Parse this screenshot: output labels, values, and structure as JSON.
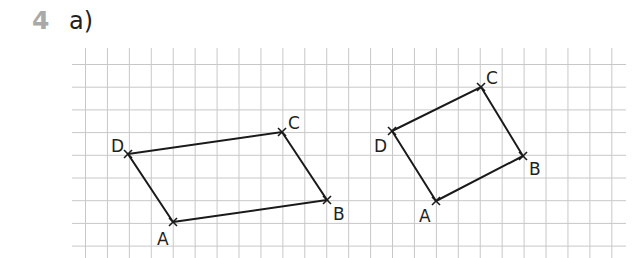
{
  "header": {
    "exercise_number": "4",
    "part_label": "a)",
    "exercise_number_color": "#a9a9a9"
  },
  "grid": {
    "x_start": 72,
    "x_end": 626,
    "y_top": 48,
    "y_bottom": 258,
    "first_vertical_x": 85.5,
    "vertical_count": 25,
    "vertical_spacing": 21.93,
    "first_horizontal_y": 64.5,
    "horizontal_count": 9,
    "horizontal_spacing": 22.7,
    "line_color": "#c8c8c8"
  },
  "shapes": [
    {
      "name": "parallelogram-1",
      "vertices": [
        {
          "label": "A",
          "x": 173,
          "y": 222,
          "label_x": 157,
          "label_y": 245
        },
        {
          "label": "B",
          "x": 327,
          "y": 200,
          "label_x": 333,
          "label_y": 220
        },
        {
          "label": "C",
          "x": 282,
          "y": 132,
          "label_x": 288,
          "label_y": 129
        },
        {
          "label": "D",
          "x": 128,
          "y": 154,
          "label_x": 111,
          "label_y": 152
        }
      ]
    },
    {
      "name": "rectangle-2",
      "vertices": [
        {
          "label": "A",
          "x": 436,
          "y": 201,
          "label_x": 419,
          "label_y": 222
        },
        {
          "label": "B",
          "x": 523,
          "y": 156,
          "label_x": 529,
          "label_y": 175
        },
        {
          "label": "C",
          "x": 481,
          "y": 87,
          "label_x": 486,
          "label_y": 84
        },
        {
          "label": "D",
          "x": 392,
          "y": 131,
          "label_x": 374,
          "label_y": 152
        }
      ]
    }
  ]
}
